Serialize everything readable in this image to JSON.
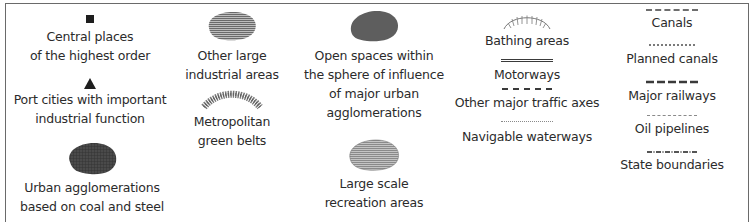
{
  "legend": {
    "columns": [
      {
        "items": [
          {
            "symbol": "black-square",
            "label": "Central places\nof the highest order"
          },
          {
            "symbol": "black-triangle",
            "label": "Port cities with important\nindustrial function"
          },
          {
            "symbol": "dark-crosshatch-blob",
            "label": "Urban agglomerations\nbased on coal and steel"
          }
        ]
      },
      {
        "items": [
          {
            "symbol": "horizontal-hatch-blob",
            "label": "Other large\nindustrial areas"
          },
          {
            "symbol": "stippled-arc-band",
            "label": "Metropolitan\ngreen belts"
          }
        ]
      },
      {
        "items": [
          {
            "symbol": "dark-grey-blob",
            "label": "Open spaces within\nthe sphere of influence\nof major urban\nagglomerations"
          },
          {
            "symbol": "light-hatch-blob",
            "label": "Large scale\nrecreation areas"
          }
        ]
      },
      {
        "items": [
          {
            "symbol": "comb-arc",
            "label": "Bathing areas"
          },
          {
            "symbol": "solid-double-line",
            "label": "Motorways"
          },
          {
            "symbol": "dashed-line",
            "label": "Other major traffic axes"
          },
          {
            "symbol": "thin-dotted-line",
            "label": "Navigable waterways"
          }
        ]
      },
      {
        "items": [
          {
            "symbol": "dash-dot-line",
            "label": "Canals"
          },
          {
            "symbol": "short-dash-line",
            "label": "Planned canals"
          },
          {
            "symbol": "long-dash-line",
            "label": "Major railways"
          },
          {
            "symbol": "fine-dash-line",
            "label": "Oil pipelines"
          },
          {
            "symbol": "cross-dash-line",
            "label": "State boundaries"
          }
        ]
      }
    ],
    "colors": {
      "text": "#2b2b2b",
      "symbol_dark": "#3a3a3a",
      "symbol_mid": "#6e6e6e",
      "symbol_light": "#9a9a9a",
      "frame": "#6a6a6a"
    }
  }
}
